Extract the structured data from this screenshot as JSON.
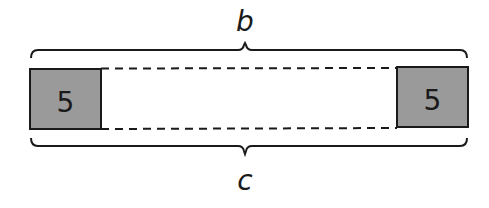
{
  "diagram": {
    "top_label": "b",
    "bottom_label": "c",
    "left_box": {
      "value": "5"
    },
    "right_box": {
      "value": "5"
    },
    "colors": {
      "box_fill": "#9a9a9a",
      "stroke": "#1a1a1a",
      "background": "#ffffff"
    }
  }
}
